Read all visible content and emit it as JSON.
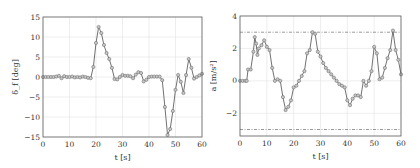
{
  "chart_data": [
    {
      "id": "steering",
      "type": "line",
      "title": "",
      "xlabel": "t [s]",
      "ylabel": "δ_f [deg]",
      "xlim": [
        0,
        60
      ],
      "ylim": [
        -15,
        15
      ],
      "xticks": [
        0,
        10,
        20,
        30,
        40,
        50,
        60
      ],
      "yticks": [
        -15,
        -10,
        -5,
        0,
        5,
        10,
        15
      ],
      "xtick_labels": [
        "0",
        "10",
        "20",
        "30",
        "40",
        "50",
        "60"
      ],
      "ytick_labels": [
        "−15",
        "−10",
        "−5",
        "0",
        "5",
        "10",
        "15"
      ],
      "grid": true,
      "legend": "none",
      "series": [
        {
          "name": "δ_f",
          "markers": true,
          "x": [
            0,
            1,
            2,
            3,
            4,
            5,
            6,
            7,
            8,
            9,
            10,
            11,
            12,
            13,
            14,
            15,
            16,
            17,
            18,
            19,
            20,
            21,
            22,
            23,
            24,
            25,
            26,
            27,
            28,
            29,
            30,
            31,
            32,
            33,
            34,
            35,
            36,
            37,
            38,
            39,
            40,
            41,
            42,
            43,
            44,
            45,
            46,
            47,
            48,
            49,
            50,
            51,
            52,
            53,
            54,
            55,
            56,
            57,
            58,
            59,
            60
          ],
          "values": [
            0,
            0,
            0,
            0,
            0,
            0.1,
            0.3,
            -0.3,
            0.2,
            0,
            0,
            0.1,
            -0.1,
            0,
            -0.1,
            0.1,
            0,
            -0.2,
            -0.3,
            2.5,
            8.5,
            12.5,
            11,
            8,
            6,
            4.5,
            2.3,
            -0.5,
            -0.6,
            0,
            0.5,
            0.3,
            0.3,
            0.2,
            -0.3,
            0.6,
            1.2,
            1,
            -1.1,
            -0.7,
            0,
            0.1,
            0.1,
            0.1,
            0.1,
            -0.8,
            -7.5,
            -14.5,
            -13,
            -8.5,
            -3.2,
            0.5,
            -1.2,
            -4,
            0.5,
            4.5,
            2.3,
            -0.4,
            0,
            0.4,
            0.8
          ]
        }
      ]
    },
    {
      "id": "acceleration",
      "type": "line",
      "title": "",
      "xlabel": "t [s]",
      "ylabel": "a [m/s²]",
      "xlim": [
        0,
        60
      ],
      "ylim": [
        -3.4,
        4
      ],
      "xticks": [
        0,
        10,
        20,
        30,
        40,
        50,
        60
      ],
      "yticks": [
        -2,
        0,
        2,
        4
      ],
      "xtick_labels": [
        "0",
        "10",
        "20",
        "30",
        "40",
        "50",
        "60"
      ],
      "ytick_labels": [
        "−2",
        "0",
        "2",
        "4"
      ],
      "grid": true,
      "legend": "none",
      "reference_lines": [
        {
          "name": "upper-limit",
          "y": 3.0,
          "style": "dash-dot"
        },
        {
          "name": "lower-limit",
          "y": -3.0,
          "style": "dash-dot"
        }
      ],
      "series": [
        {
          "name": "a",
          "markers": true,
          "x": [
            0,
            1,
            2,
            2.5,
            3,
            4,
            5,
            5.5,
            6,
            6.5,
            7,
            8,
            9,
            10,
            11,
            12,
            13,
            14,
            15,
            16,
            17,
            18,
            19,
            20,
            21,
            22,
            23,
            24,
            25,
            26,
            27,
            28,
            29,
            30,
            31,
            32,
            33,
            34,
            35,
            36,
            37,
            38,
            39,
            40,
            41,
            42,
            43,
            44,
            45,
            46,
            47,
            48,
            49,
            50,
            51,
            52,
            53,
            54,
            55,
            56,
            57,
            58,
            59,
            60
          ],
          "values": [
            0,
            0,
            0,
            0,
            0.7,
            0.7,
            1.8,
            2.7,
            2.3,
            1.6,
            2,
            2.2,
            2.5,
            2.1,
            1.9,
            0.8,
            0,
            0.1,
            0,
            -1,
            -1.8,
            -1.6,
            -1.2,
            -0.4,
            -0.3,
            0,
            0.3,
            0.6,
            1.7,
            1.9,
            3,
            2.9,
            1.8,
            1.5,
            1.1,
            0.8,
            0.6,
            0.4,
            0.2,
            0,
            -0.2,
            -0.3,
            -0.4,
            -1.2,
            -1.5,
            -1.1,
            -0.9,
            -0.9,
            -1,
            0,
            -0.3,
            0,
            0.6,
            2.1,
            1.7,
            0.1,
            0.2,
            0.8,
            1.4,
            1.9,
            3.1,
            1.9,
            1.3,
            0.4
          ]
        }
      ]
    }
  ]
}
